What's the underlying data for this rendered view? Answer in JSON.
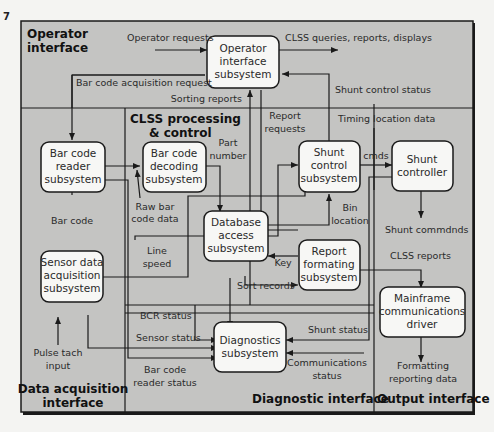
{
  "corner_mark": "7",
  "regions": {
    "operator": [
      "Operator",
      "interface"
    ],
    "processing": [
      "CLSS processing",
      "& control"
    ],
    "data_acquisition": [
      "Data acquisition",
      "interface"
    ],
    "diagnostic": "Diagnostic interface",
    "output": "Output interface"
  },
  "boxes": {
    "operator_interface": [
      "Operator",
      "interface",
      "subsystem"
    ],
    "bar_code_reader": [
      "Bar code",
      "reader",
      "subsystem"
    ],
    "bar_code_decoding": [
      "Bar code",
      "decoding",
      "subsystem"
    ],
    "shunt_control": [
      "Shunt",
      "control",
      "subsystem"
    ],
    "shunt_controller": [
      "Shunt",
      "controller"
    ],
    "database_access": [
      "Database",
      "access",
      "subsystem"
    ],
    "report_formating": [
      "Report",
      "formating",
      "subsystem"
    ],
    "sensor_data": [
      "Sensor data",
      "acquisition",
      "subsystem"
    ],
    "mainframe": [
      "Mainframe",
      "communications",
      "driver"
    ],
    "diagnostics": [
      "Diagnostics",
      "subsystem"
    ]
  },
  "labels": {
    "operator_requests": "Operator requests",
    "clss_queries": "CLSS queries, reports, displays",
    "bar_code_acq_request": "Bar code acquisition request",
    "sorting_reports": "Sorting reports",
    "shunt_control_status": "Shunt control status",
    "report_requests": [
      "Report",
      "requests"
    ],
    "timing_location": "Timing location data",
    "part_number": [
      "Part",
      "number"
    ],
    "cmds": "cmds",
    "bar_code": "Bar code",
    "raw_bar_code": [
      "Raw bar",
      "code data"
    ],
    "bin_location": [
      "Bin",
      "location"
    ],
    "shunt_commands": "Shunt commdnds",
    "line_speed": [
      "Line",
      "speed"
    ],
    "key": "Key",
    "sort_records": "Sort records",
    "clss_reports": "CLSS reports",
    "bcr_status": "BCR status",
    "sensor_status": "Sensor status",
    "shunt_status": "Shunt status",
    "pulse_tach": [
      "Pulse tach",
      "input"
    ],
    "bar_code_reader_status": [
      "Bar code",
      "reader status"
    ],
    "communications_status": [
      "Communications",
      "status"
    ],
    "formatting_data": [
      "Formatting",
      "reporting data"
    ]
  },
  "colors": {
    "panel": "#c4c4c2",
    "box": "#f7f7f5",
    "stroke": "#1a1a1a",
    "background": "#f4f4f2"
  }
}
